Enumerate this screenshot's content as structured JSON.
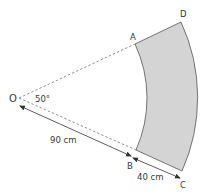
{
  "diagram": {
    "type": "annular sector",
    "points": {
      "O": "O",
      "A": "A",
      "B": "B",
      "C": "C",
      "D": "D"
    },
    "angle_label": "50°",
    "inner_radius_label": "90 cm",
    "width_label": "40 cm",
    "colors": {
      "shaded_region": "#d4d4d4",
      "outline": "#555555",
      "dashed_line": "#777777",
      "text": "#3a3a3a"
    }
  }
}
